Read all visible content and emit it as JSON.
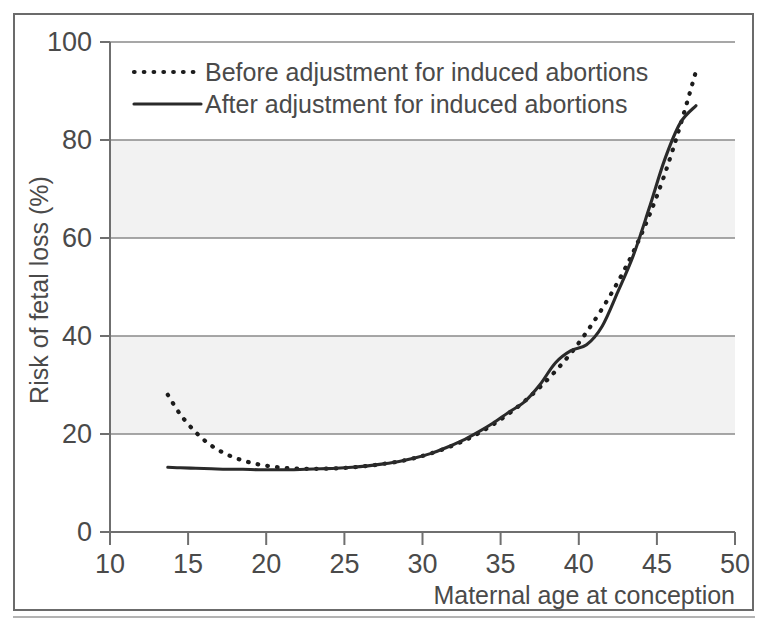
{
  "figure": {
    "frame_border_color": "#6b6b6b",
    "background_color": "#ffffff",
    "band_color": "#f2f2f2",
    "ink_color": "#2a2a2a"
  },
  "axes": {
    "y_title": "Risk of fetal loss (%)",
    "x_title": "Maternal age at conception",
    "y_ticks": [
      "0",
      "20",
      "40",
      "60",
      "80",
      "100"
    ],
    "x_ticks": [
      "10",
      "15",
      "20",
      "25",
      "30",
      "35",
      "40",
      "45",
      "50"
    ]
  },
  "legend": {
    "entries": [
      {
        "label": "Before adjustment for induced abortions",
        "style": "dotted"
      },
      {
        "label": "After adjustment for induced abortions",
        "style": "solid"
      }
    ]
  },
  "caption": {
    "text": ""
  },
  "chart_data": {
    "type": "line",
    "title": "",
    "subtitle": "",
    "xlabel": "Maternal age at conception",
    "ylabel": "Risk of fetal loss (%)",
    "xlim": [
      10,
      50
    ],
    "ylim": [
      0,
      100
    ],
    "xticks": [
      10,
      15,
      20,
      25,
      30,
      35,
      40,
      45,
      50
    ],
    "yticks": [
      0,
      20,
      40,
      60,
      80,
      100
    ],
    "grid": true,
    "grid_axis": "y",
    "shaded_bands": [
      [
        20,
        40
      ],
      [
        60,
        80
      ]
    ],
    "legend_position": "upper-left-inside",
    "series": [
      {
        "name": "Before adjustment for induced abortions",
        "style": "dotted",
        "x": [
          13.7,
          14.5,
          15.5,
          16.5,
          17.5,
          18.5,
          19.5,
          20.5,
          21.5,
          22.5,
          23.5,
          24.5,
          25.5,
          26.5,
          27.5,
          28.5,
          29.5,
          30.5,
          31.5,
          32.5,
          33.5,
          34.5,
          35.5,
          36.5,
          37.5,
          38.5,
          39.5,
          40.5,
          41.5,
          42.5,
          43.5,
          44.5,
          45.5,
          46.5,
          47.5
        ],
        "values": [
          28.0,
          24.0,
          20.3,
          17.6,
          15.8,
          14.6,
          13.8,
          13.3,
          13.0,
          12.9,
          12.9,
          13.0,
          13.2,
          13.5,
          13.9,
          14.4,
          15.1,
          16.0,
          17.1,
          18.4,
          20.0,
          21.9,
          24.1,
          26.6,
          29.5,
          32.8,
          36.5,
          40.8,
          45.6,
          51.0,
          57.2,
          64.5,
          73.0,
          83.0,
          94.0
        ]
      },
      {
        "name": "After adjustment for induced abortions",
        "style": "solid",
        "x": [
          13.7,
          14.5,
          15.5,
          16.5,
          17.5,
          18.5,
          19.5,
          20.5,
          21.5,
          22.5,
          23.5,
          24.5,
          25.5,
          26.5,
          27.5,
          28.5,
          29.5,
          30.5,
          31.5,
          32.5,
          33.5,
          34.5,
          35.5,
          36.5,
          37.5,
          38.5,
          39.5,
          40.5,
          41.5,
          42.5,
          43.5,
          44.5,
          45.5,
          46.5,
          47.5
        ],
        "values": [
          13.2,
          13.1,
          13.0,
          12.9,
          12.8,
          12.8,
          12.7,
          12.7,
          12.7,
          12.8,
          12.9,
          13.0,
          13.2,
          13.5,
          13.9,
          14.4,
          15.1,
          16.0,
          17.2,
          18.6,
          20.3,
          22.2,
          24.4,
          26.5,
          30.0,
          34.5,
          37.0,
          38.2,
          42.0,
          49.0,
          56.5,
          66.0,
          76.0,
          83.5,
          87.0
        ]
      }
    ],
    "annotations": {
      "crossover_age": 33.5,
      "crossover_value": 20
    }
  }
}
